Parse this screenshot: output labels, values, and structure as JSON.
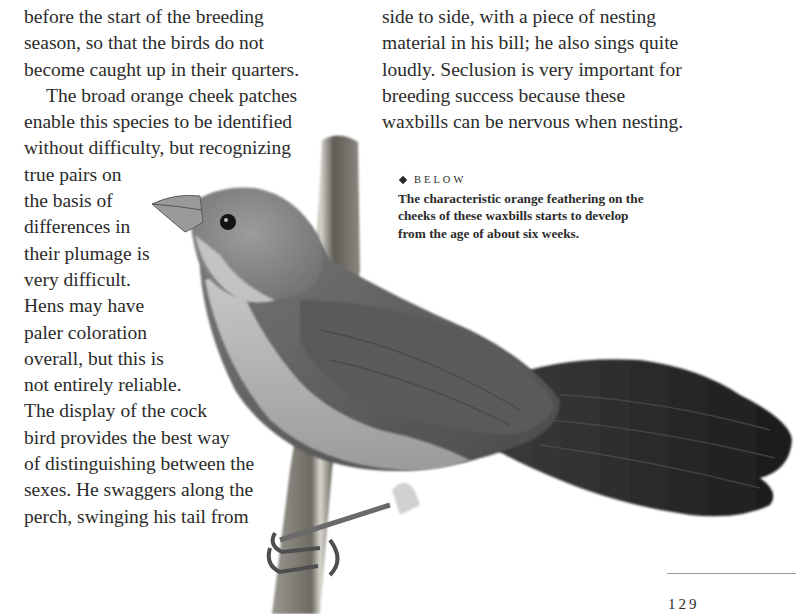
{
  "left_column": {
    "lines": [
      "before the start of the breeding",
      "season, so that the birds do not",
      "become caught up in their quarters.",
      "The broad orange cheek patches",
      "enable this species to be identified",
      "without difficulty, but recognizing",
      "true pairs on",
      "the basis of",
      "differences in",
      "their plumage is",
      "very difficult.",
      "Hens may have",
      "paler coloration",
      "overall, but this is",
      "not entirely reliable.",
      "The display of the cock",
      "bird provides the best way",
      "of distinguishing between the",
      "sexes. He swaggers along the",
      "perch, swinging his tail from"
    ]
  },
  "right_column": {
    "lines": [
      "side to side, with a piece of nesting",
      "material in his bill; he also sings quite",
      "loudly. Seclusion is very important for",
      "breeding success because these",
      "waxbills can be nervous when nesting."
    ]
  },
  "caption": {
    "label": "BELOW",
    "lines": [
      "The characteristic orange feathering on the",
      "cheeks of these waxbills starts to develop",
      "from the age of about six weeks."
    ]
  },
  "image": {
    "subject": "Waxbill perched on a reed stem",
    "colors": {
      "body": "#6e6e6e",
      "head": "#8a8a8a",
      "throat": "#c9c9c9",
      "tail": "#2a2a2a",
      "perch": "#7a7a72"
    }
  },
  "footer": {
    "page_number": "129"
  }
}
